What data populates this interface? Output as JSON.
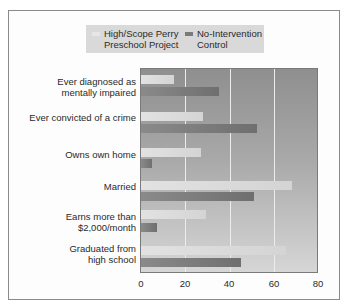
{
  "legend": {
    "items": [
      {
        "label_line1": "High/Scope Perry",
        "label_line2": "Preschool Project",
        "color": "#e0e0e0"
      },
      {
        "label_line1": "No-Intervention",
        "label_line2": "Control",
        "color": "#7a7a7a"
      }
    ]
  },
  "categories": [
    {
      "line1": "Ever diagnosed as",
      "line2": "mentally impaired"
    },
    {
      "line1": "Ever convicted of a crime",
      "line2": ""
    },
    {
      "line1": "Owns own home",
      "line2": ""
    },
    {
      "line1": "Married",
      "line2": ""
    },
    {
      "line1": "Earns more than",
      "line2": "$2,000/month"
    },
    {
      "line1": "Graduated from",
      "line2": "high school"
    }
  ],
  "x_ticks": [
    "0",
    "20",
    "40",
    "60",
    "80"
  ],
  "chart_data": {
    "type": "bar",
    "orientation": "horizontal",
    "title": "",
    "xlabel": "",
    "ylabel": "",
    "categories": [
      "Ever diagnosed as mentally impaired",
      "Ever convicted of a crime",
      "Owns own home",
      "Married",
      "Earns more than $2,000/month",
      "Graduated from high school"
    ],
    "series": [
      {
        "name": "High/Scope Perry Preschool Project",
        "values": [
          15,
          28,
          27,
          68,
          29,
          65
        ]
      },
      {
        "name": "No-Intervention Control",
        "values": [
          35,
          52,
          5,
          51,
          7,
          45
        ]
      }
    ],
    "xlim": [
      0,
      80
    ],
    "x_ticks": [
      0,
      20,
      40,
      60,
      80
    ],
    "grid": "vertical",
    "legend_position": "top"
  }
}
